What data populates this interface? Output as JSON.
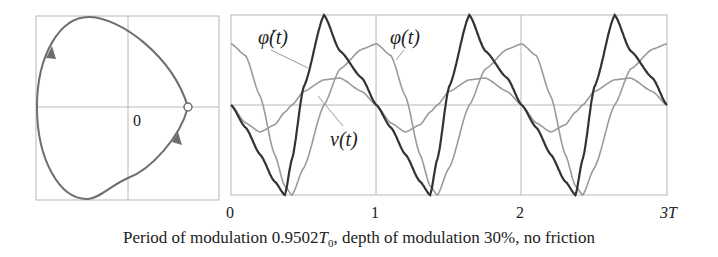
{
  "figure": {
    "caption_prefix": "Period of modulation ",
    "caption_value": "0.9502",
    "caption_T": "T",
    "caption_T_sub": "0",
    "caption_suffix": ", depth of modulation 30%, no friction",
    "colors": {
      "phi_dot": "#333333",
      "phi": "#9a9a9a",
      "nu": "#9a9a9a",
      "phase": "#6e6e6e",
      "grid": "#b8b8b8"
    }
  },
  "chart_data": [
    {
      "type": "line",
      "title": "Phase trajectory",
      "xlabel": "φ",
      "ylabel": "φ̇",
      "annotations": [
        "0"
      ],
      "description": "Closed heart-shaped phase orbit, traversed clockwise (arrows downward on right side, upward on left side); starting point marked with open circle on positive φ axis.",
      "grid": true,
      "points_xy": [
        [
          0.66,
          0.0
        ],
        [
          0.5,
          -0.45
        ],
        [
          0.2,
          -0.82
        ],
        [
          -0.45,
          -1.0
        ],
        [
          -0.85,
          -0.75
        ],
        [
          -1.0,
          0.0
        ],
        [
          -0.85,
          0.75
        ],
        [
          -0.45,
          1.0
        ],
        [
          0.2,
          0.82
        ],
        [
          0.5,
          0.45
        ],
        [
          0.66,
          0.0
        ]
      ],
      "start_marker": [
        0.66,
        0.0
      ]
    },
    {
      "type": "line",
      "title": "Time dependence",
      "x_tick_labels": [
        "0",
        "1",
        "2",
        "3T"
      ],
      "xlim": [
        0,
        3
      ],
      "ylim": [
        -1,
        1
      ],
      "grid": true,
      "x": [
        0,
        0.1,
        0.2,
        0.3,
        0.37,
        0.42,
        0.5,
        0.64,
        0.75,
        0.9,
        1.0
      ],
      "series": [
        {
          "name": "φ̇(t)",
          "label": "φ̇(t)",
          "values": [
            0,
            -0.25,
            -0.55,
            -0.85,
            -1.0,
            -0.6,
            0.2,
            1.0,
            0.6,
            0.3,
            0
          ]
        },
        {
          "name": "φ(t)",
          "label": "φ(t)",
          "values": [
            0.68,
            0.55,
            0.1,
            -0.55,
            -0.9,
            -1.0,
            -0.7,
            0.0,
            0.4,
            0.62,
            0.68
          ]
        },
        {
          "name": "ν(t)",
          "label": "ν(t)",
          "values": [
            0,
            -0.2,
            -0.3,
            -0.22,
            -0.08,
            0.0,
            0.15,
            0.28,
            0.3,
            0.15,
            0
          ]
        }
      ],
      "period_repeats": 3
    }
  ],
  "labels": {
    "zero": "0",
    "phi_dot": "φ̇(t)",
    "phi": "φ(t)",
    "nu": "ν(t)",
    "tick0": "0",
    "tick1": "1",
    "tick2": "2",
    "tick3": "3T"
  }
}
